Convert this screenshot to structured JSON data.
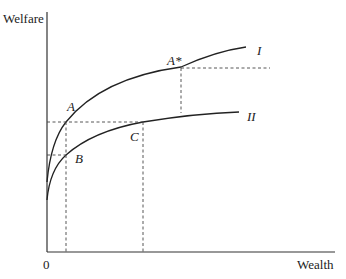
{
  "diagram": {
    "type": "economics-curves",
    "axes": {
      "y_label": "Welfare",
      "x_label": "Wealth",
      "origin_label": "0"
    },
    "curves": [
      {
        "id": "I",
        "label": "I"
      },
      {
        "id": "II",
        "label": "II"
      }
    ],
    "points": {
      "A": "A",
      "A_star": "A*",
      "B": "B",
      "C": "C"
    },
    "guides": {
      "dashed_horizontal": [
        "A-C welfare level",
        "B welfare level",
        "A* welfare level"
      ],
      "dashed_vertical": [
        "A/B wealth level",
        "C wealth level",
        "A* down to curve II"
      ]
    },
    "colors": {
      "line": "#222222",
      "background": "#ffffff"
    }
  }
}
